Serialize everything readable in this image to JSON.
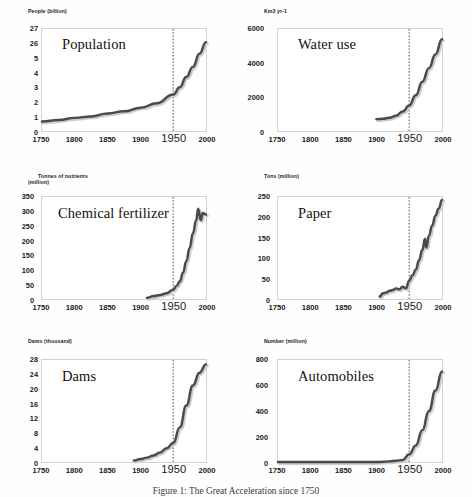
{
  "figure": {
    "caption": "Figure 1: The Great Acceleration since 1750",
    "line_color": "#4a4a4a",
    "marker_year_color": "#3a3a3a",
    "frame_color": "#d2d2d2"
  },
  "chart_data": [
    {
      "type": "line",
      "title": "Population",
      "ylabel": "People (billion)",
      "xlabel": "",
      "xlim": [
        1750,
        2000
      ],
      "ylim": [
        0,
        7
      ],
      "xticks": [
        1750,
        1800,
        1850,
        1900,
        1950,
        2000
      ],
      "xticklabels": [
        "1750",
        "1800",
        "1850",
        "1900",
        "1950",
        "2000"
      ],
      "yticks": [
        0,
        1,
        2,
        3,
        4,
        5,
        6,
        7
      ],
      "yticklabels": [
        "0",
        "1",
        "2",
        "3",
        "4",
        "5",
        "26",
        "27"
      ],
      "grid": false,
      "legend": "none",
      "annotation_year": 1950,
      "x": [
        1750,
        1775,
        1800,
        1825,
        1850,
        1875,
        1900,
        1925,
        1950,
        1960,
        1970,
        1980,
        1990,
        2000
      ],
      "values": [
        0.65,
        0.75,
        0.9,
        1.0,
        1.2,
        1.35,
        1.6,
        1.9,
        2.5,
        3.0,
        3.7,
        4.4,
        5.3,
        6.1
      ]
    },
    {
      "type": "line",
      "title": "Water use",
      "ylabel": "Km3 yr-1",
      "xlabel": "",
      "xlim": [
        1750,
        2000
      ],
      "ylim": [
        0,
        6000
      ],
      "xticks": [
        1750,
        1800,
        1850,
        1900,
        1950,
        2000
      ],
      "xticklabels": [
        "1750",
        "1800",
        "1850",
        "1900",
        "1950",
        "2000"
      ],
      "yticks": [
        0,
        2000,
        4000,
        6000
      ],
      "yticklabels": [
        "0",
        "2000",
        "4000",
        "6000"
      ],
      "grid": false,
      "legend": "none",
      "annotation_year": 1950,
      "x": [
        1900,
        1910,
        1920,
        1930,
        1940,
        1950,
        1960,
        1970,
        1980,
        1990,
        2000
      ],
      "values": [
        700,
        720,
        780,
        900,
        1150,
        1500,
        2100,
        2900,
        3700,
        4500,
        5400
      ]
    },
    {
      "type": "line",
      "title": "Chemical fertilizer",
      "ylabel": "Tonnes of nutrients\n(million)",
      "xlabel": "",
      "xlim": [
        1750,
        2000
      ],
      "ylim": [
        0,
        350
      ],
      "xticks": [
        1750,
        1800,
        1850,
        1900,
        1950,
        2000
      ],
      "xticklabels": [
        "1750",
        "1800",
        "1850",
        "1900",
        "1950",
        "2000"
      ],
      "yticks": [
        0,
        50,
        100,
        150,
        200,
        250,
        300,
        350
      ],
      "yticklabels": [
        "0",
        "50",
        "100",
        "150",
        "200",
        "250",
        "300",
        "350"
      ],
      "grid": false,
      "legend": "none",
      "annotation_year": 1950,
      "x": [
        1910,
        1920,
        1930,
        1940,
        1950,
        1955,
        1960,
        1965,
        1970,
        1975,
        1980,
        1985,
        1988,
        1992,
        1995,
        2000
      ],
      "values": [
        4,
        10,
        14,
        20,
        32,
        45,
        60,
        90,
        130,
        175,
        225,
        270,
        310,
        270,
        295,
        290
      ]
    },
    {
      "type": "line",
      "title": "Paper",
      "ylabel": "Tons (million)",
      "xlabel": "",
      "xlim": [
        1750,
        2000
      ],
      "ylim": [
        0,
        250
      ],
      "xticks": [
        1750,
        1800,
        1850,
        1900,
        1950,
        2000
      ],
      "xticklabels": [
        "1750",
        "1800",
        "1850",
        "1900",
        "1950",
        "2000"
      ],
      "yticks": [
        0,
        50,
        100,
        150,
        200,
        250
      ],
      "yticklabels": [
        "0",
        "50",
        "100",
        "150",
        "200",
        "250"
      ],
      "grid": false,
      "legend": "none",
      "annotation_year": 1950,
      "x": [
        1905,
        1910,
        1915,
        1920,
        1925,
        1930,
        1935,
        1940,
        1945,
        1950,
        1955,
        1960,
        1965,
        1970,
        1974,
        1976,
        1980,
        1985,
        1990,
        1995,
        2000
      ],
      "values": [
        6,
        14,
        16,
        20,
        22,
        26,
        24,
        30,
        26,
        45,
        58,
        72,
        95,
        120,
        148,
        126,
        155,
        180,
        205,
        222,
        243
      ]
    },
    {
      "type": "line",
      "title": "Dams",
      "ylabel": "Dams (thousand)",
      "xlabel": "",
      "xlim": [
        1750,
        2000
      ],
      "ylim": [
        0,
        28
      ],
      "xticks": [
        1750,
        1800,
        1850,
        1900,
        1950,
        2000
      ],
      "xticklabels": [
        "1750",
        "1800",
        "1850",
        "1900",
        "1950",
        "2000"
      ],
      "yticks": [
        0,
        4,
        8,
        12,
        16,
        20,
        24,
        28
      ],
      "yticklabels": [
        "0",
        "4",
        "8",
        "12",
        "16",
        "20",
        "24",
        "28"
      ],
      "grid": false,
      "legend": "none",
      "annotation_year": 1950,
      "x": [
        1890,
        1900,
        1910,
        1920,
        1930,
        1940,
        1950,
        1960,
        1970,
        1980,
        1990,
        2000
      ],
      "values": [
        0.4,
        0.8,
        1.2,
        1.8,
        2.6,
        3.8,
        5.2,
        9.5,
        15.5,
        21.0,
        24.5,
        26.8
      ]
    },
    {
      "type": "line",
      "title": "Automobiles",
      "ylabel": "Number (million)",
      "xlabel": "",
      "xlim": [
        1750,
        2000
      ],
      "ylim": [
        0,
        800
      ],
      "xticks": [
        1750,
        1800,
        1850,
        1900,
        1950,
        2000
      ],
      "xticklabels": [
        "1750",
        "1800",
        "1850",
        "1900",
        "1950",
        "2000"
      ],
      "yticks": [
        0,
        200,
        400,
        600,
        800
      ],
      "yticklabels": [
        "0",
        "200",
        "400",
        "600",
        "800"
      ],
      "grid": false,
      "legend": "none",
      "annotation_year": 1950,
      "x": [
        1750,
        1850,
        1900,
        1920,
        1930,
        1940,
        1950,
        1960,
        1970,
        1980,
        1990,
        2000
      ],
      "values": [
        0,
        0,
        0,
        5,
        10,
        15,
        60,
        130,
        250,
        400,
        560,
        710
      ]
    }
  ]
}
